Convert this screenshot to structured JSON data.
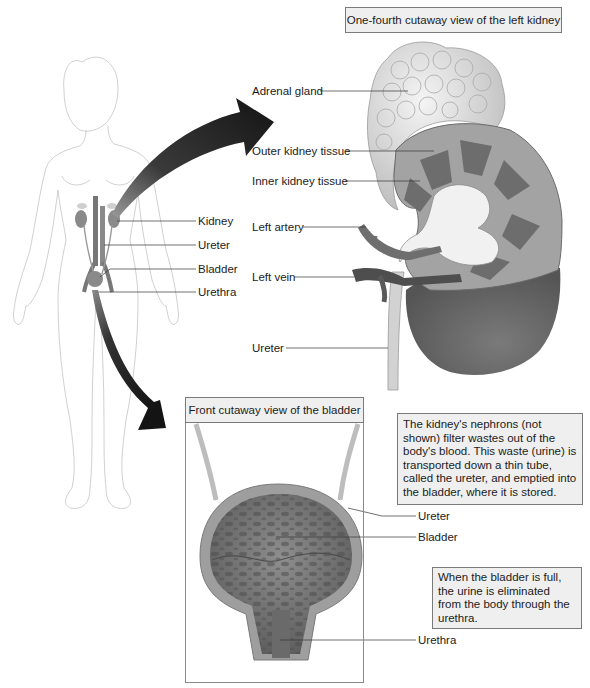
{
  "figure": {
    "kidney_panel": {
      "title": "One-fourth cutaway view of the left kidney",
      "labels": {
        "adrenal_gland": "Adrenal gland",
        "outer_kidney_tissue": "Outer kidney tissue",
        "inner_kidney_tissue": "Inner kidney tissue",
        "left_artery": "Left artery",
        "left_vein": "Left vein",
        "ureter": "Ureter"
      }
    },
    "body_panel": {
      "labels": {
        "kidney": "Kidney",
        "ureter": "Ureter",
        "bladder": "Bladder",
        "urethra": "Urethra"
      }
    },
    "bladder_panel": {
      "title": "Front cutaway view of the bladder",
      "labels": {
        "ureter": "Ureter",
        "bladder": "Bladder",
        "urethra": "Urethra"
      }
    },
    "callouts": {
      "nephron_text": "The kidney's nephrons (not shown) filter wastes out of the body's blood. This waste (urine) is transported down a thin tube, called the ureter, and emptied into the bladder, where it is stored.",
      "urethra_text": "When the bladder is full, the urine is eliminated from the body through the urethra."
    },
    "colors": {
      "arrow": "#1e1e1e",
      "organ_fill": "#8a8a8a",
      "box_fill": "#efefef",
      "box_border": "#7a7a7a"
    }
  }
}
